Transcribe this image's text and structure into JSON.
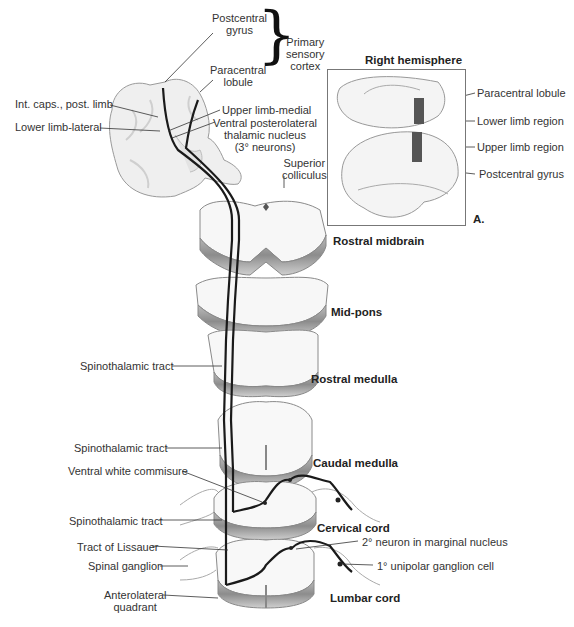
{
  "figure": {
    "panel_letter": "A.",
    "inset_title": "Right hemisphere",
    "cortex_group": {
      "line1": "Primary",
      "line2": "sensory",
      "line3": "cortex"
    },
    "left_labels": {
      "postcentral_gyrus": {
        "line1": "Postcentral",
        "line2": "gyrus"
      },
      "paracentral_lobule": {
        "line1": "Paracentral",
        "line2": "lobule"
      },
      "int_caps": "Int. caps., post. limb",
      "lower_limb_lateral": "Lower limb-lateral",
      "upper_limb_medial": "Upper limb-medial",
      "vpl": {
        "line1": "Ventral posterolateral",
        "line2": "thalamic nucleus",
        "line3": "(3° neurons)"
      },
      "superior_colliculus": {
        "line1": "Superior",
        "line2": "colliculus"
      },
      "spinothalamic_1": "Spinothalamic tract",
      "spinothalamic_2": "Spinothalamic tract",
      "ventral_white": "Ventral white commisure",
      "spinothalamic_3": "Spinothalamic tract",
      "lissauer": "Tract of Lissauer",
      "spinal_ganglion": "Spinal ganglion",
      "anterolateral": {
        "line1": "Anterolateral",
        "line2": "quadrant"
      },
      "second_neuron": "2° neuron in marginal nucleus",
      "first_neuron": "1° unipolar ganglion cell"
    },
    "inset_labels": {
      "paracentral": "Paracentral lobule",
      "lower_limb": "Lower limb region",
      "upper_limb": "Upper limb region",
      "postcentral": "Postcentral gyrus"
    },
    "levels": {
      "rostral_midbrain": "Rostral midbrain",
      "mid_pons": "Mid-pons",
      "rostral_medulla": "Rostral medulla",
      "caudal_medulla": "Caudal medulla",
      "cervical_cord": "Cervical cord",
      "lumbar_cord": "Lumbar cord"
    },
    "colors": {
      "tract": "#1a1a1a",
      "tissue_fill": "#f6f6f6",
      "tissue_edge": "#8a8a8a",
      "region_highlight": "#555555"
    }
  }
}
